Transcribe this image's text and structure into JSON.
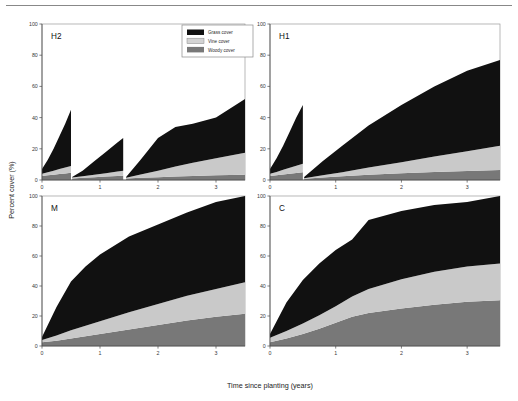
{
  "figure": {
    "xlabel": "Time since planting (years)",
    "ylabel": "Percent cover (%)",
    "legend": {
      "position": "top-center-of-first-panel",
      "entries": [
        {
          "label": "Grass cover",
          "color": "#111111",
          "name": "grass"
        },
        {
          "label": "Vine cover",
          "color": "#c9c9c9",
          "name": "vine"
        },
        {
          "label": "Woody cover",
          "color": "#787878",
          "name": "woody"
        }
      ]
    }
  },
  "chart_data": {
    "type": "area",
    "title": "",
    "xlabel": "Time since planting (years)",
    "ylabel": "Percent cover (%)",
    "xlim": [
      0,
      3.5
    ],
    "ylim": [
      0,
      100
    ],
    "xticks": [
      0,
      1,
      2,
      3
    ],
    "yticks": [
      0,
      20,
      40,
      60,
      80,
      100
    ],
    "xtick_labels": [
      "0",
      "1",
      "2",
      "3"
    ],
    "ytick_labels": [
      "0",
      "20",
      "40",
      "60",
      "80",
      "100"
    ],
    "grid": false,
    "stacking_order_bottom_to_top": [
      "Woody cover",
      "Vine cover",
      "Grass cover"
    ],
    "panels": [
      {
        "id": "H2",
        "label": "H2",
        "position": "top-left",
        "note": "Three mowing/disturbance resets producing sawtooth segments",
        "segments": [
          {
            "x": [
              0.0,
              0.1,
              0.2,
              0.3,
              0.4,
              0.5
            ],
            "woody": [
              2.5,
              3.0,
              3.4,
              3.8,
              4.2,
              4.6
            ],
            "vine": [
              1.5,
              2.0,
              2.6,
              3.2,
              3.8,
              4.4
            ],
            "grass": [
              3.0,
              8.0,
              14.0,
              21.0,
              28.0,
              36.0
            ],
            "total_top": [
              7.0,
              13.0,
              20.0,
              28.0,
              36.0,
              45.0
            ]
          },
          {
            "x": [
              0.52,
              0.7,
              0.9,
              1.1,
              1.3,
              1.4
            ],
            "woody": [
              1.0,
              1.4,
              1.8,
              2.2,
              2.6,
              2.8
            ],
            "vine": [
              0.6,
              1.0,
              1.6,
              2.2,
              2.8,
              3.2
            ],
            "grass": [
              0.4,
              3.6,
              8.6,
              13.6,
              18.6,
              21.0
            ],
            "total_top": [
              2.0,
              6.0,
              12.0,
              18.0,
              24.0,
              27.0
            ]
          },
          {
            "x": [
              1.45,
              1.7,
              2.0,
              2.3,
              2.6,
              3.0,
              3.5
            ],
            "woody": [
              1.0,
              1.4,
              1.8,
              2.2,
              2.6,
              3.0,
              3.4
            ],
            "vine": [
              0.5,
              2.1,
              4.2,
              6.4,
              8.4,
              11.0,
              14.0
            ],
            "grass": [
              0.5,
              9.5,
              21.0,
              25.4,
              25.0,
              26.0,
              34.6
            ],
            "total_top": [
              2.0,
              13.0,
              27.0,
              34.0,
              36.0,
              40.0,
              52.0
            ]
          }
        ]
      },
      {
        "id": "H1",
        "label": "H1",
        "position": "top-right",
        "note": "Single mowing/disturbance reset at about 0.5 years",
        "segments": [
          {
            "x": [
              0.0,
              0.1,
              0.2,
              0.3,
              0.4,
              0.5
            ],
            "woody": [
              2.5,
              3.0,
              3.5,
              4.0,
              4.5,
              5.0
            ],
            "vine": [
              1.5,
              2.2,
              3.0,
              3.8,
              4.6,
              5.4
            ],
            "grass": [
              3.0,
              8.8,
              15.5,
              23.2,
              30.9,
              37.6
            ],
            "total_top": [
              7.0,
              14.0,
              22.0,
              31.0,
              40.0,
              48.0
            ]
          },
          {
            "x": [
              0.52,
              0.8,
              1.1,
              1.5,
              2.0,
              2.5,
              3.0,
              3.5
            ],
            "woody": [
              0.8,
              1.6,
              2.4,
              3.4,
              4.4,
              5.2,
              5.8,
              6.4
            ],
            "vine": [
              0.4,
              1.4,
              2.6,
              4.6,
              7.0,
              9.8,
              12.6,
              15.6
            ],
            "grass": [
              0.8,
              9.0,
              17.0,
              27.0,
              36.6,
              45.0,
              51.6,
              55.0
            ],
            "total_top": [
              2.0,
              12.0,
              22.0,
              35.0,
              48.0,
              60.0,
              70.0,
              77.0
            ]
          }
        ]
      },
      {
        "id": "M",
        "label": "M",
        "position": "bottom-left",
        "note": "Continuous saturating growth reaching full cover",
        "segments": [
          {
            "x": [
              0.0,
              0.25,
              0.5,
              0.75,
              1.0,
              1.5,
              2.0,
              2.5,
              3.0,
              3.5
            ],
            "woody": [
              2.5,
              3.5,
              5.0,
              6.5,
              8.0,
              11.0,
              14.0,
              17.0,
              19.5,
              21.5
            ],
            "vine": [
              1.5,
              3.5,
              5.5,
              7.0,
              8.5,
              11.5,
              14.0,
              16.5,
              18.5,
              21.0
            ],
            "grass": [
              2.0,
              19.0,
              32.5,
              39.5,
              44.5,
              50.5,
              53.0,
              55.5,
              58.0,
              57.5
            ],
            "total_top": [
              6.0,
              26.0,
              43.0,
              53.0,
              61.0,
              73.0,
              81.0,
              89.0,
              96.0,
              100.0
            ]
          }
        ]
      },
      {
        "id": "C",
        "label": "C",
        "position": "bottom-right",
        "note": "Control: fastest saturating growth, largest woody and vine fractions",
        "segments": [
          {
            "x": [
              0.0,
              0.25,
              0.5,
              0.75,
              1.0,
              1.25,
              1.5,
              2.0,
              2.5,
              3.0,
              3.5
            ],
            "woody": [
              2.5,
              5.0,
              8.0,
              11.5,
              15.5,
              19.5,
              22.0,
              25.0,
              27.5,
              29.5,
              30.5
            ],
            "vine": [
              3.0,
              5.0,
              7.0,
              9.0,
              11.0,
              13.5,
              16.0,
              19.5,
              22.0,
              23.5,
              24.5
            ],
            "grass": [
              2.5,
              19.0,
              29.0,
              34.5,
              37.5,
              38.0,
              46.0,
              45.5,
              44.5,
              43.0,
              45.0
            ],
            "total_top": [
              8.0,
              29.0,
              44.0,
              55.0,
              64.0,
              71.0,
              84.0,
              90.0,
              94.0,
              96.0,
              100.0
            ]
          }
        ]
      }
    ]
  }
}
